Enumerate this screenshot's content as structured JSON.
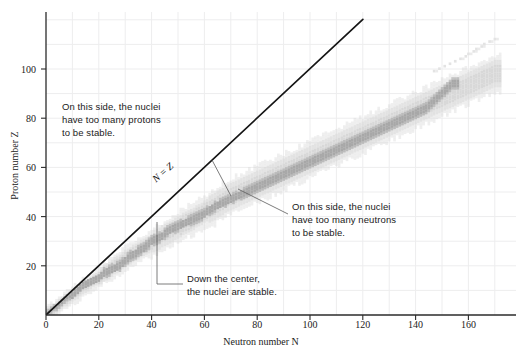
{
  "figure": {
    "kind": "nuclear-stability-chart",
    "background_color": "#ffffff",
    "grid_color": "#eceded",
    "axis_color": "#2b2b2b",
    "band_unstable_color": "#d8d8d8",
    "band_stable_color": "#a8a8a8",
    "nz_line_color": "#151515",
    "leader_line_color": "#555555"
  },
  "axes": {
    "x": {
      "label": "Neutron number N",
      "label_text": "Neutron number",
      "label_symbol": "N",
      "min": 0,
      "max": 178,
      "ticks": [
        0,
        20,
        40,
        60,
        80,
        100,
        120,
        140,
        160
      ],
      "tick_labels": [
        "0",
        "20",
        "40",
        "60",
        "80",
        "100",
        "120",
        "140",
        "160"
      ],
      "minor_step": 10
    },
    "y": {
      "label": "Proton number Z",
      "label_text": "Proton number",
      "label_symbol": "Z",
      "min": 0,
      "max": 123,
      "ticks": [
        20,
        40,
        60,
        80,
        100
      ],
      "tick_labels": [
        "20",
        "40",
        "60",
        "80",
        "100"
      ],
      "minor_step": 10
    }
  },
  "annotations": {
    "protons": {
      "lines": [
        "On this side, the nuclei",
        "have too many protons",
        "to be stable."
      ],
      "text": "On this side, the nuclei have too many protons to be stable."
    },
    "neutrons": {
      "lines": [
        "On this side, the nuclei",
        "have too many neutrons",
        "to be stable."
      ],
      "text": "On this side, the nuclei have too many neutrons to be stable."
    },
    "stable": {
      "lines": [
        "Down the center,",
        "the nuclei are stable."
      ],
      "text": "Down the center, the nuclei are stable."
    },
    "nz_line": {
      "label": "N = Z"
    }
  },
  "chart_data": {
    "type": "scatter",
    "title": "",
    "subtitle": "",
    "xlabel": "Neutron number N",
    "ylabel": "Proton number Z",
    "xlim": [
      0,
      178
    ],
    "ylim": [
      0,
      123
    ],
    "grid": true,
    "legend": "none",
    "reference_line": {
      "name": "N = Z",
      "type": "line",
      "equation": "Z = N",
      "x": [
        0,
        120
      ],
      "y": [
        0,
        120
      ],
      "color": "#151515",
      "width": 1.7,
      "label": "N = Z",
      "label_x": 62,
      "label_y": 62
    },
    "series": [
      {
        "name": "Known nuclides (unstable)",
        "color": "#d8d8d8",
        "description": "Broad light-gray band of known but radioactive nuclides straddling the valley of stability",
        "band_half_width": 5.5,
        "points": [
          [
            1,
            1
          ],
          [
            2,
            2
          ],
          [
            3,
            2
          ],
          [
            4,
            3
          ],
          [
            5,
            4
          ],
          [
            6,
            5
          ],
          [
            7,
            6
          ],
          [
            8,
            6
          ],
          [
            9,
            7
          ],
          [
            10,
            8
          ],
          [
            12,
            9
          ],
          [
            13,
            10
          ],
          [
            14,
            11
          ],
          [
            16,
            12
          ],
          [
            17,
            13
          ],
          [
            18,
            14
          ],
          [
            20,
            15
          ],
          [
            21,
            16
          ],
          [
            22,
            17
          ],
          [
            24,
            18
          ],
          [
            25,
            19
          ],
          [
            26,
            20
          ],
          [
            28,
            21
          ],
          [
            29,
            22
          ],
          [
            30,
            23
          ],
          [
            32,
            24
          ],
          [
            33,
            25
          ],
          [
            35,
            26
          ],
          [
            36,
            27
          ],
          [
            38,
            28
          ],
          [
            40,
            29
          ],
          [
            41,
            30
          ],
          [
            43,
            31
          ],
          [
            44,
            32
          ],
          [
            46,
            33
          ],
          [
            48,
            34
          ],
          [
            49,
            35
          ],
          [
            51,
            36
          ],
          [
            52,
            37
          ],
          [
            54,
            38
          ],
          [
            56,
            39
          ],
          [
            57,
            40
          ],
          [
            59,
            41
          ],
          [
            60,
            42
          ],
          [
            62,
            43
          ],
          [
            64,
            44
          ],
          [
            65,
            45
          ],
          [
            67,
            46
          ],
          [
            68,
            47
          ],
          [
            70,
            48
          ],
          [
            72,
            49
          ],
          [
            74,
            50
          ],
          [
            76,
            51
          ],
          [
            78,
            52
          ],
          [
            80,
            53
          ],
          [
            82,
            54
          ],
          [
            84,
            55
          ],
          [
            86,
            56
          ],
          [
            88,
            57
          ],
          [
            90,
            58
          ],
          [
            92,
            59
          ],
          [
            94,
            60
          ],
          [
            96,
            61
          ],
          [
            98,
            62
          ],
          [
            100,
            63
          ],
          [
            102,
            64
          ],
          [
            104,
            65
          ],
          [
            106,
            66
          ],
          [
            108,
            67
          ],
          [
            110,
            68
          ],
          [
            112,
            69
          ],
          [
            114,
            70
          ],
          [
            116,
            71
          ],
          [
            118,
            72
          ],
          [
            120,
            73
          ],
          [
            122,
            74
          ],
          [
            124,
            75
          ],
          [
            126,
            76
          ],
          [
            128,
            77
          ],
          [
            130,
            78
          ],
          [
            132,
            79
          ],
          [
            134,
            80
          ],
          [
            136,
            81
          ],
          [
            138,
            82
          ],
          [
            140,
            83
          ],
          [
            142,
            84
          ],
          [
            144,
            85
          ],
          [
            146,
            86
          ],
          [
            148,
            87
          ],
          [
            150,
            88
          ],
          [
            152,
            89
          ],
          [
            154,
            90
          ],
          [
            156,
            91
          ],
          [
            158,
            92
          ],
          [
            160,
            93
          ],
          [
            162,
            94
          ],
          [
            164,
            95
          ],
          [
            166,
            96
          ],
          [
            168,
            97
          ],
          [
            170,
            98
          ]
        ]
      },
      {
        "name": "Stable nuclides",
        "color": "#a8a8a8",
        "description": "Darker core running down the center of the band: the valley of stability",
        "band_half_width": 2.2,
        "points": [
          [
            0,
            1
          ],
          [
            1,
            1
          ],
          [
            2,
            2
          ],
          [
            3,
            3
          ],
          [
            4,
            3
          ],
          [
            5,
            4
          ],
          [
            6,
            5
          ],
          [
            7,
            6
          ],
          [
            8,
            7
          ],
          [
            10,
            8
          ],
          [
            11,
            9
          ],
          [
            12,
            10
          ],
          [
            13,
            11
          ],
          [
            14,
            12
          ],
          [
            16,
            13
          ],
          [
            18,
            14
          ],
          [
            20,
            15
          ],
          [
            21,
            16
          ],
          [
            22,
            17
          ],
          [
            24,
            18
          ],
          [
            26,
            19
          ],
          [
            28,
            20
          ],
          [
            29,
            21
          ],
          [
            30,
            22
          ],
          [
            31,
            23
          ],
          [
            32,
            24
          ],
          [
            34,
            25
          ],
          [
            35,
            26
          ],
          [
            37,
            27
          ],
          [
            38,
            28
          ],
          [
            39,
            29
          ],
          [
            40,
            30
          ],
          [
            42,
            31
          ],
          [
            44,
            32
          ],
          [
            45,
            33
          ],
          [
            46,
            34
          ],
          [
            48,
            35
          ],
          [
            50,
            36
          ],
          [
            52,
            37
          ],
          [
            54,
            38
          ],
          [
            56,
            39
          ],
          [
            58,
            40
          ],
          [
            60,
            41
          ],
          [
            61,
            42
          ],
          [
            64,
            44
          ],
          [
            66,
            45
          ],
          [
            68,
            46
          ],
          [
            70,
            47
          ],
          [
            72,
            48
          ],
          [
            74,
            49
          ],
          [
            76,
            50
          ],
          [
            78,
            51
          ],
          [
            80,
            52
          ],
          [
            82,
            53
          ],
          [
            84,
            54
          ],
          [
            86,
            55
          ],
          [
            88,
            56
          ],
          [
            90,
            57
          ],
          [
            92,
            58
          ],
          [
            94,
            59
          ],
          [
            96,
            60
          ],
          [
            100,
            62
          ],
          [
            102,
            63
          ],
          [
            104,
            64
          ],
          [
            106,
            65
          ],
          [
            108,
            66
          ],
          [
            110,
            67
          ],
          [
            112,
            68
          ],
          [
            114,
            69
          ],
          [
            116,
            70
          ],
          [
            118,
            71
          ],
          [
            120,
            72
          ],
          [
            122,
            73
          ],
          [
            124,
            74
          ],
          [
            126,
            75
          ],
          [
            128,
            76
          ],
          [
            130,
            77
          ],
          [
            132,
            78
          ],
          [
            134,
            79
          ],
          [
            136,
            80
          ],
          [
            138,
            81
          ],
          [
            140,
            82
          ],
          [
            142,
            83
          ],
          [
            144,
            84
          ],
          [
            146,
            86
          ],
          [
            148,
            88
          ],
          [
            150,
            90
          ],
          [
            152,
            92
          ],
          [
            154,
            94
          ]
        ]
      },
      {
        "name": "Superheavy nuclides",
        "color": "#e2e2e2",
        "description": "Sparse isolated squares beyond Z = 105 near the upper right",
        "points": [
          [
            157,
            104
          ],
          [
            159,
            105
          ],
          [
            160,
            106
          ],
          [
            162,
            107
          ],
          [
            163,
            108
          ],
          [
            165,
            109
          ],
          [
            166,
            110
          ],
          [
            168,
            111
          ],
          [
            170,
            112
          ],
          [
            155,
            103
          ],
          [
            153,
            102
          ],
          [
            151,
            101
          ],
          [
            149,
            100
          ],
          [
            147,
            99
          ]
        ]
      }
    ]
  }
}
